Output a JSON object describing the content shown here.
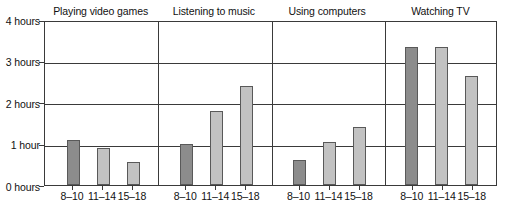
{
  "chart_data": {
    "type": "bar",
    "title": "",
    "xlabel": "",
    "ylabel": "",
    "ylim": [
      0,
      4
    ],
    "grid": true,
    "legend": "none",
    "y_tick_labels": [
      "0 hours",
      "1 hour",
      "2 hours",
      "3 hours",
      "4 hours"
    ],
    "y_tick_values": [
      0,
      1,
      2,
      3,
      4
    ],
    "categories": [
      "8–10",
      "11–14",
      "15–18"
    ],
    "panels": [
      {
        "title": "Playing video games",
        "values": [
          1.1,
          0.9,
          0.55
        ]
      },
      {
        "title": "Listening to music",
        "values": [
          1.0,
          1.8,
          2.4
        ]
      },
      {
        "title": "Using computers",
        "values": [
          0.6,
          1.05,
          1.4
        ]
      },
      {
        "title": "Watching TV",
        "values": [
          3.35,
          3.35,
          2.65
        ]
      }
    ],
    "bar_colors": [
      "#8c8c8c",
      "#c2c2c2",
      "#c2c2c2"
    ],
    "bar_edge_color": "#595959",
    "axis_color": "#3a3a3a"
  }
}
